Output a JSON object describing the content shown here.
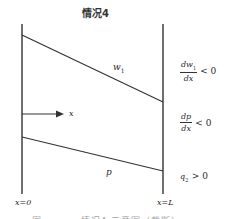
{
  "title": "情况4",
  "curves": {
    "w1_label": "w",
    "w1_sub": "1",
    "p_label": "p"
  },
  "axis": {
    "x_label": "x",
    "left_boundary": "x=0",
    "right_boundary": "x=L"
  },
  "annotations": [
    {
      "num": "dw",
      "num_sub": "1",
      "den": "dx",
      "relation": "< 0"
    },
    {
      "num": "dp",
      "num_sub": "",
      "den": "dx",
      "relation": "< 0"
    },
    {
      "text": "q",
      "sub": "2",
      "relation": "> 0"
    }
  ],
  "caption": "图 ·· · · · 情况4 示意图（截断）",
  "colors": {
    "line": "#333333",
    "background": "#ffffff"
  }
}
